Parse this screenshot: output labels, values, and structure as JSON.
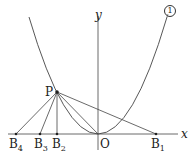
{
  "diagram": {
    "type": "coordinate-geometry",
    "axes": {
      "x_label": "x",
      "y_label": "y",
      "origin_label": "O"
    },
    "curve": {
      "label": "①",
      "kind": "parabola",
      "vertex": "O"
    },
    "point_P": {
      "label": "P"
    },
    "points_on_x_axis": [
      {
        "label": "B",
        "sub": "4"
      },
      {
        "label": "B",
        "sub": "3"
      },
      {
        "label": "B",
        "sub": "2"
      },
      {
        "label": "B",
        "sub": "1"
      }
    ],
    "segments": [
      "P-B4",
      "P-B3",
      "P-B2",
      "P-O",
      "P-B1"
    ]
  }
}
